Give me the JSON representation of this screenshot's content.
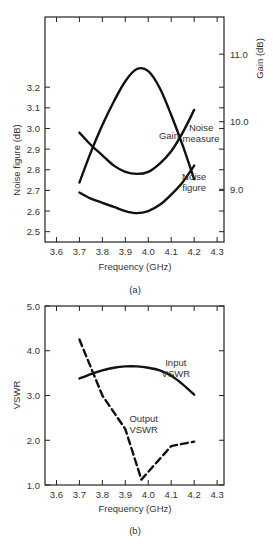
{
  "chart_data": [
    {
      "id": "a",
      "type": "line",
      "caption": "(a)",
      "xlabel": "Frequency (GHz)",
      "ylabel": "Noise figure (dB)",
      "ylabel_right": "Gain (dB)",
      "xlim": [
        3.55,
        4.33
      ],
      "ylim": [
        2.45,
        3.54
      ],
      "ylim_right": [
        8.22,
        11.55
      ],
      "grid": false,
      "x_ticks": [
        3.6,
        3.7,
        3.8,
        3.9,
        4.0,
        4.1,
        4.2,
        4.3
      ],
      "x_tick_labels": [
        "3.6",
        "3.7",
        "3.8",
        "3.9",
        "4.0",
        "4.1",
        "4.2",
        "4.3"
      ],
      "y_ticks": [
        2.5,
        2.6,
        2.7,
        2.8,
        2.9,
        3.0,
        3.1,
        3.2
      ],
      "y_tick_labels": [
        "2.5",
        "2.6",
        "2.7",
        "2.8",
        "2.9",
        "3.0",
        "3.1",
        "3.2"
      ],
      "y_ticks_right": [
        9.0,
        10.0,
        11.0
      ],
      "y_tick_labels_right": [
        "9.0",
        "10.0",
        "11.0"
      ],
      "series": [
        {
          "name": "Gain",
          "axis": "right",
          "style": "solid",
          "x": [
            3.7,
            3.75,
            3.8,
            3.85,
            3.9,
            3.95,
            4.0,
            4.05,
            4.1,
            4.15,
            4.2
          ],
          "values": [
            9.1,
            9.55,
            9.95,
            10.3,
            10.6,
            10.78,
            10.75,
            10.5,
            10.1,
            9.65,
            9.15
          ],
          "label": "Gain",
          "label_pos": [
            4.09,
            9.75
          ]
        },
        {
          "name": "Noise measure",
          "axis": "left",
          "style": "solid",
          "x": [
            3.7,
            3.75,
            3.8,
            3.85,
            3.9,
            3.95,
            4.0,
            4.05,
            4.1,
            4.15,
            4.2
          ],
          "values": [
            2.98,
            2.92,
            2.87,
            2.82,
            2.79,
            2.78,
            2.79,
            2.83,
            2.89,
            2.98,
            3.09
          ],
          "label": [
            "Noise",
            "measure"
          ],
          "label_pos": [
            4.23,
            2.99
          ]
        },
        {
          "name": "Noise figure",
          "axis": "left",
          "style": "solid",
          "x": [
            3.7,
            3.75,
            3.8,
            3.85,
            3.9,
            3.95,
            4.0,
            4.05,
            4.1,
            4.15,
            4.2
          ],
          "values": [
            2.69,
            2.66,
            2.64,
            2.62,
            2.6,
            2.59,
            2.6,
            2.63,
            2.68,
            2.74,
            2.82
          ],
          "label": [
            "Noise",
            "figure"
          ],
          "label_pos": [
            4.2,
            2.75
          ]
        }
      ]
    },
    {
      "id": "b",
      "type": "line",
      "caption": "(b)",
      "xlabel": "Frequency (GHz)",
      "ylabel": "VSWR",
      "xlim": [
        3.55,
        4.33
      ],
      "ylim": [
        1.0,
        5.0
      ],
      "grid": false,
      "x_ticks": [
        3.6,
        3.7,
        3.8,
        3.9,
        4.0,
        4.1,
        4.2,
        4.3
      ],
      "x_tick_labels": [
        "3.6",
        "3.7",
        "3.8",
        "3.9",
        "4.0",
        "4.1",
        "4.2",
        "4.3"
      ],
      "y_ticks": [
        1.0,
        2.0,
        3.0,
        4.0,
        5.0
      ],
      "y_tick_labels": [
        "1.0",
        "2.0",
        "3.0",
        "4.0",
        "5.0"
      ],
      "series": [
        {
          "name": "Input VSWR",
          "style": "solid",
          "x": [
            3.7,
            3.75,
            3.8,
            3.85,
            3.9,
            3.95,
            4.0,
            4.05,
            4.1,
            4.15,
            4.2
          ],
          "values": [
            3.38,
            3.48,
            3.56,
            3.62,
            3.65,
            3.65,
            3.62,
            3.56,
            3.44,
            3.25,
            3.02
          ],
          "label": [
            "Input",
            "VSWR"
          ],
          "label_pos": [
            4.12,
            3.65
          ]
        },
        {
          "name": "Output VSWR",
          "style": "dashed",
          "x": [
            3.7,
            3.8,
            3.9,
            3.97,
            4.1,
            4.2
          ],
          "values": [
            4.25,
            3.0,
            2.25,
            1.12,
            1.87,
            1.97
          ],
          "label": [
            "Output",
            "VSWR"
          ],
          "label_pos": [
            3.98,
            2.4
          ]
        }
      ]
    }
  ]
}
